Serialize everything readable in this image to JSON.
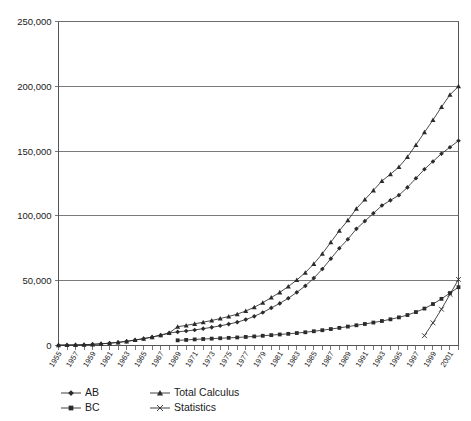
{
  "chart_data": {
    "type": "line",
    "title": "",
    "subtitle": "",
    "xlabel": "",
    "ylabel": "",
    "grid": "horizontal",
    "legend_position": "bottom-left",
    "ylim": [
      0,
      250000
    ],
    "ytick_values": [
      0,
      50000,
      100000,
      150000,
      200000,
      250000
    ],
    "ytick_labels": [
      "0",
      "50,000",
      "100,000",
      "150,000",
      "200,000",
      "250,000"
    ],
    "xlim": [
      1955,
      2002
    ],
    "xtick_labels": [
      "1955",
      "1957",
      "1959",
      "1961",
      "1963",
      "1965",
      "1967",
      "1969",
      "1971",
      "1973",
      "1975",
      "1977",
      "1979",
      "1981",
      "1983",
      "1985",
      "1987",
      "1989",
      "1991",
      "1993",
      "1995",
      "1997",
      "1999",
      "2001"
    ],
    "x": [
      1955,
      1956,
      1957,
      1958,
      1959,
      1960,
      1961,
      1962,
      1963,
      1964,
      1965,
      1966,
      1967,
      1968,
      1969,
      1970,
      1971,
      1972,
      1973,
      1974,
      1975,
      1976,
      1977,
      1978,
      1979,
      1980,
      1981,
      1982,
      1983,
      1984,
      1985,
      1986,
      1987,
      1988,
      1989,
      1990,
      1991,
      1992,
      1993,
      1994,
      1995,
      1996,
      1997,
      1998,
      1999,
      2000,
      2001,
      2002
    ],
    "series": [
      {
        "name": "AB",
        "marker": "diamond",
        "values": [
          285,
          350,
          450,
          600,
          900,
          1300,
          1800,
          2400,
          3200,
          4200,
          5300,
          6500,
          8000,
          9600,
          10500,
          11200,
          12000,
          13000,
          14000,
          15200,
          16500,
          18000,
          20000,
          22500,
          25500,
          29000,
          32500,
          36500,
          41000,
          46000,
          52000,
          59000,
          67000,
          75000,
          82000,
          90000,
          96000,
          102000,
          108000,
          112000,
          116000,
          122000,
          129000,
          136000,
          142000,
          148000,
          153000,
          158000
        ]
      },
      {
        "name": "BC",
        "marker": "square",
        "values": [
          null,
          null,
          null,
          null,
          null,
          null,
          null,
          null,
          null,
          null,
          null,
          null,
          null,
          null,
          4000,
          4300,
          4700,
          5000,
          5300,
          5600,
          5900,
          6200,
          6600,
          7000,
          7500,
          8000,
          8500,
          9000,
          9600,
          10200,
          11000,
          11800,
          12700,
          13600,
          14600,
          15600,
          16600,
          17700,
          18900,
          20200,
          21700,
          23500,
          25800,
          28500,
          32000,
          36000,
          40500,
          45000
        ]
      },
      {
        "name": "Total Calculus",
        "marker": "triangle",
        "values": [
          285,
          350,
          450,
          600,
          900,
          1300,
          1800,
          2400,
          3200,
          4200,
          5300,
          6500,
          8000,
          9600,
          14500,
          15500,
          16700,
          18000,
          19300,
          20800,
          22400,
          24200,
          26600,
          29500,
          33000,
          37000,
          41000,
          45500,
          50600,
          56200,
          63000,
          70800,
          79700,
          88600,
          96600,
          105600,
          112600,
          119700,
          126900,
          132200,
          137700,
          145500,
          154800,
          164500,
          174000,
          184000,
          193500,
          200000
        ]
      },
      {
        "name": "Statistics",
        "marker": "x",
        "values": [
          null,
          null,
          null,
          null,
          null,
          null,
          null,
          null,
          null,
          null,
          null,
          null,
          null,
          null,
          null,
          null,
          null,
          null,
          null,
          null,
          null,
          null,
          null,
          null,
          null,
          null,
          null,
          null,
          null,
          null,
          null,
          null,
          null,
          null,
          null,
          null,
          null,
          null,
          null,
          null,
          null,
          null,
          null,
          7600,
          17500,
          28000,
          39500,
          51000
        ]
      }
    ]
  },
  "legend": {
    "items": [
      {
        "label": "AB",
        "marker": "diamond"
      },
      {
        "label": "Total Calculus",
        "marker": "triangle"
      },
      {
        "label": "BC",
        "marker": "square"
      },
      {
        "label": "Statistics",
        "marker": "x"
      }
    ]
  },
  "colors": {
    "series": "#2b2b2b",
    "grid": "#6b6b6b",
    "axis": "#555555",
    "background": "#ffffff",
    "text": "#1a1a1a"
  }
}
